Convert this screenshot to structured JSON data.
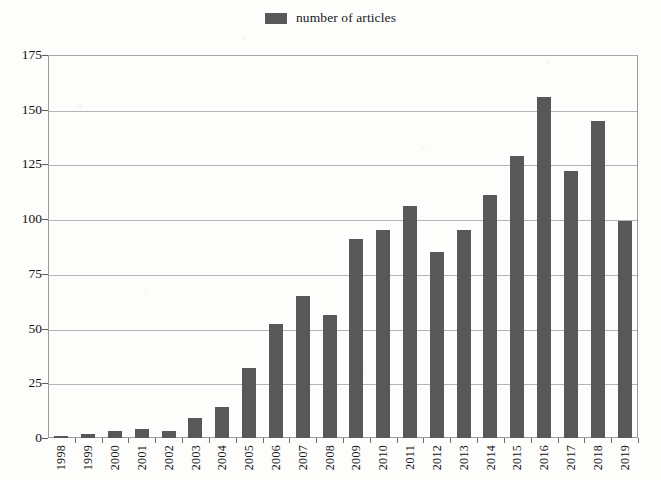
{
  "chart_data": {
    "type": "bar",
    "title": "",
    "subtitle": "",
    "xlabel": "",
    "ylabel": "",
    "legend": [
      {
        "name": "number of articles",
        "color": "#58585a"
      }
    ],
    "legend_position": "top-center",
    "grid": true,
    "grid_axis": "y",
    "ylim": [
      0,
      175
    ],
    "yticks": [
      0,
      25,
      50,
      75,
      100,
      125,
      150,
      175
    ],
    "ytick_labels": [
      "0",
      "25",
      "50",
      "75",
      "100",
      "125",
      "150",
      "175"
    ],
    "categories": [
      "1998",
      "1999",
      "2000",
      "2001",
      "2002",
      "2003",
      "2004",
      "2005",
      "2006",
      "2007",
      "2008",
      "2009",
      "2010",
      "2011",
      "2012",
      "2013",
      "2014",
      "2015",
      "2016",
      "2017",
      "2018",
      "2019"
    ],
    "series": [
      {
        "name": "number of articles",
        "color": "#58585a",
        "values": [
          1,
          2,
          3,
          4,
          3,
          9,
          14,
          32,
          52,
          65,
          56,
          91,
          95,
          106,
          85,
          95,
          111,
          129,
          156,
          122,
          145,
          99
        ]
      }
    ]
  },
  "legend": {
    "label": "number of articles"
  }
}
